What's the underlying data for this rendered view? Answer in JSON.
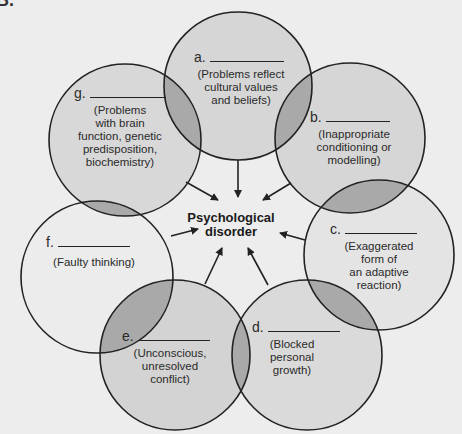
{
  "corner_mark": "B.",
  "center": {
    "label": "Psychological\ndisorder"
  },
  "circles": [
    {
      "letter": "a.",
      "description": "(Problems reflect\ncultural values\nand beliefs)",
      "fill": "#d6d6d6"
    },
    {
      "letter": "b.",
      "description": "(Inappropriate\nconditioning or\nmodelling)",
      "fill": "#d6d6d6"
    },
    {
      "letter": "c.",
      "description": "(Exaggerated\nform of\nan adaptive\nreaction)",
      "fill": "#e4e4e4"
    },
    {
      "letter": "d.",
      "description": "(Blocked\npersonal\ngrowth)",
      "fill": "#dadada"
    },
    {
      "letter": "e.",
      "description": "(Unconscious,\nunresolved\nconflict)",
      "fill": "#d3d3d3"
    },
    {
      "letter": "f.",
      "description": "(Faulty thinking)",
      "fill": "#ececec"
    },
    {
      "letter": "g.",
      "description": "(Problems\nwith brain\nfunction, genetic\npredisposition,\nbiochemistry)",
      "fill": "#d8d8d8"
    }
  ],
  "colors": {
    "background": "#ededed",
    "overlap": "#a9a9a9",
    "stroke": "#222222"
  }
}
